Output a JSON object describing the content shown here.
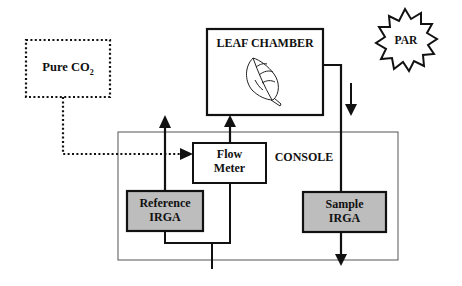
{
  "diagram": {
    "type": "flow",
    "nodes": {
      "pure_co2": {
        "label": "Pure CO",
        "subscript": "2"
      },
      "leaf_chamber": {
        "label": "LEAF CHAMBER"
      },
      "par": {
        "label": "PAR"
      },
      "console": {
        "label": "CONSOLE"
      },
      "flow_meter": {
        "line1": "Flow",
        "line2": "Meter"
      },
      "reference_irga": {
        "line1": "Reference",
        "line2": "IRGA"
      },
      "sample_irga": {
        "line1": "Sample",
        "line2": "IRGA"
      }
    },
    "edges": [
      {
        "from": "pure_co2",
        "to": "flow_meter",
        "style": "dotted"
      },
      {
        "from": "inlet",
        "to": "reference_irga",
        "style": "solid"
      },
      {
        "from": "inlet",
        "to": "flow_meter",
        "style": "solid"
      },
      {
        "from": "reference_irga",
        "to": "exhaust_up",
        "style": "solid"
      },
      {
        "from": "flow_meter",
        "to": "leaf_chamber",
        "style": "solid"
      },
      {
        "from": "leaf_chamber",
        "to": "sample_irga",
        "style": "solid"
      },
      {
        "from": "sample_irga",
        "to": "exhaust_down",
        "style": "solid"
      }
    ],
    "colors": {
      "irga_fill": "#bdbdbd",
      "line": "#111111",
      "console_border": "#555555"
    }
  }
}
